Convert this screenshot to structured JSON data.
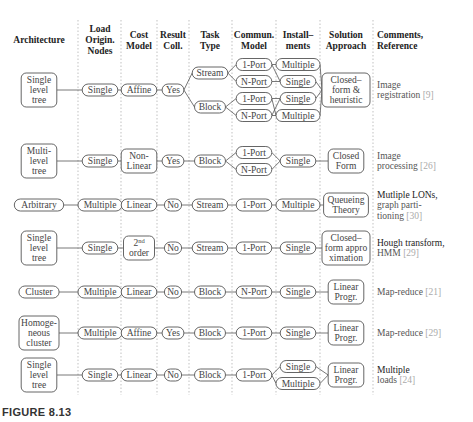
{
  "headers": [
    [
      "Architecture"
    ],
    [
      "Load",
      "Origin.",
      "Nodes"
    ],
    [
      "Cost",
      "Model"
    ],
    [
      "Result",
      "Coll."
    ],
    [
      "Task",
      "Type"
    ],
    [
      "Commun.",
      "Model"
    ],
    [
      "Install–",
      "ments"
    ],
    [
      "Solution",
      "Approach"
    ],
    [
      "Comments,",
      "Reference"
    ]
  ],
  "rows": [
    {
      "nodes": [
        {
          "id": "arch",
          "col": 0,
          "lines": [
            "Single",
            "level",
            "tree"
          ]
        },
        {
          "id": "load",
          "col": 1,
          "lines": [
            "Single"
          ]
        },
        {
          "id": "cost",
          "col": 2,
          "lines": [
            "Affine"
          ]
        },
        {
          "id": "coll",
          "col": 3,
          "lines": [
            "Yes"
          ]
        },
        {
          "id": "t1",
          "col": 4,
          "lines": [
            "Stream"
          ],
          "slot": -2
        },
        {
          "id": "t2",
          "col": 4,
          "lines": [
            "Block"
          ],
          "slot": 2
        },
        {
          "id": "c1",
          "col": 5,
          "lines": [
            "1-Port"
          ],
          "slot": -3
        },
        {
          "id": "c2",
          "col": 5,
          "lines": [
            "N-Port"
          ],
          "slot": -1
        },
        {
          "id": "c3",
          "col": 5,
          "lines": [
            "1-Port"
          ],
          "slot": 1
        },
        {
          "id": "c4",
          "col": 5,
          "lines": [
            "N-Port"
          ],
          "slot": 3
        },
        {
          "id": "i1",
          "col": 6,
          "lines": [
            "Multiple"
          ],
          "slot": -3
        },
        {
          "id": "i2",
          "col": 6,
          "lines": [
            "Single"
          ],
          "slot": -1
        },
        {
          "id": "i3",
          "col": 6,
          "lines": [
            "Single"
          ],
          "slot": 1
        },
        {
          "id": "i4",
          "col": 6,
          "lines": [
            "Multiple"
          ],
          "slot": 3
        },
        {
          "id": "sol",
          "col": 7,
          "lines": [
            "Closed–",
            "form &",
            "heuristic"
          ]
        }
      ],
      "edges": [
        [
          "arch",
          "load"
        ],
        [
          "load",
          "cost"
        ],
        [
          "cost",
          "coll"
        ],
        [
          "coll",
          "t1"
        ],
        [
          "coll",
          "t2"
        ],
        [
          "t1",
          "c1"
        ],
        [
          "t1",
          "c2"
        ],
        [
          "t2",
          "c3"
        ],
        [
          "t2",
          "c4"
        ],
        [
          "c1",
          "i1"
        ],
        [
          "c1",
          "i2"
        ],
        [
          "c2",
          "i2"
        ],
        [
          "c3",
          "i3"
        ],
        [
          "c3",
          "i4"
        ],
        [
          "c4",
          "i3"
        ],
        [
          "c4",
          "i4"
        ],
        [
          "i1",
          "sol"
        ],
        [
          "i2",
          "sol"
        ],
        [
          "i3",
          "sol"
        ],
        [
          "i4",
          "sol"
        ]
      ],
      "comment": {
        "lines": [
          "Image",
          "registration"
        ],
        "ref": "[9]",
        "dark": false
      }
    },
    {
      "nodes": [
        {
          "id": "arch",
          "col": 0,
          "lines": [
            "Multi-",
            "level",
            "tree"
          ]
        },
        {
          "id": "load",
          "col": 1,
          "lines": [
            "Single"
          ]
        },
        {
          "id": "cost",
          "col": 2,
          "lines": [
            "Non-",
            "Linear"
          ]
        },
        {
          "id": "coll",
          "col": 3,
          "lines": [
            "Yes"
          ]
        },
        {
          "id": "task",
          "col": 4,
          "lines": [
            "Block"
          ]
        },
        {
          "id": "c1",
          "col": 5,
          "lines": [
            "1-Port"
          ],
          "slot": -1
        },
        {
          "id": "c2",
          "col": 5,
          "lines": [
            "N-Port"
          ],
          "slot": 1
        },
        {
          "id": "inst",
          "col": 6,
          "lines": [
            "Single"
          ]
        },
        {
          "id": "sol",
          "col": 7,
          "lines": [
            "Closed",
            "Form"
          ]
        }
      ],
      "edges": [
        [
          "arch",
          "load"
        ],
        [
          "load",
          "cost"
        ],
        [
          "cost",
          "coll"
        ],
        [
          "coll",
          "task"
        ],
        [
          "task",
          "c1"
        ],
        [
          "task",
          "c2"
        ],
        [
          "c1",
          "inst"
        ],
        [
          "c2",
          "inst"
        ],
        [
          "inst",
          "sol"
        ]
      ],
      "comment": {
        "lines": [
          "Image",
          "processing"
        ],
        "ref": "[26]",
        "dark": false
      }
    },
    {
      "nodes": [
        {
          "id": "arch",
          "col": 0,
          "lines": [
            "Arbitrary"
          ]
        },
        {
          "id": "load",
          "col": 1,
          "lines": [
            "Multiple"
          ]
        },
        {
          "id": "cost",
          "col": 2,
          "lines": [
            "Linear"
          ]
        },
        {
          "id": "coll",
          "col": 3,
          "lines": [
            "No"
          ]
        },
        {
          "id": "task",
          "col": 4,
          "lines": [
            "Stream"
          ]
        },
        {
          "id": "comm",
          "col": 5,
          "lines": [
            "1-Port"
          ]
        },
        {
          "id": "inst",
          "col": 6,
          "lines": [
            "Multiple"
          ]
        },
        {
          "id": "sol",
          "col": 7,
          "lines": [
            "Queueing",
            "Theory"
          ]
        }
      ],
      "edges": [
        [
          "arch",
          "load"
        ],
        [
          "load",
          "cost"
        ],
        [
          "cost",
          "coll"
        ],
        [
          "coll",
          "task"
        ],
        [
          "task",
          "comm"
        ],
        [
          "comm",
          "inst"
        ],
        [
          "inst",
          "sol"
        ]
      ],
      "comment": {
        "lines": [
          "Mutliple LONs,",
          "graph parti-",
          "tioning"
        ],
        "ref": "[30]",
        "dark": true
      }
    },
    {
      "nodes": [
        {
          "id": "arch",
          "col": 0,
          "lines": [
            "Single",
            "level",
            "tree"
          ]
        },
        {
          "id": "load",
          "col": 1,
          "lines": [
            "Single"
          ]
        },
        {
          "id": "cost",
          "col": 2,
          "lines": [
            "2nd",
            "order"
          ],
          "sup": true
        },
        {
          "id": "coll",
          "col": 3,
          "lines": [
            "No"
          ]
        },
        {
          "id": "task",
          "col": 4,
          "lines": [
            "Stream"
          ]
        },
        {
          "id": "comm",
          "col": 5,
          "lines": [
            "1-Port"
          ]
        },
        {
          "id": "inst",
          "col": 6,
          "lines": [
            "Single"
          ]
        },
        {
          "id": "sol",
          "col": 7,
          "lines": [
            "Closed–",
            "form appro",
            "ximation"
          ]
        }
      ],
      "edges": [
        [
          "arch",
          "load"
        ],
        [
          "load",
          "cost"
        ],
        [
          "cost",
          "coll"
        ],
        [
          "coll",
          "task"
        ],
        [
          "task",
          "comm"
        ],
        [
          "comm",
          "inst"
        ],
        [
          "inst",
          "sol"
        ]
      ],
      "comment": {
        "lines": [
          "Hough transform,",
          "HMM"
        ],
        "ref": "[29]",
        "dark": true
      }
    },
    {
      "nodes": [
        {
          "id": "arch",
          "col": 0,
          "lines": [
            "Cluster"
          ]
        },
        {
          "id": "load",
          "col": 1,
          "lines": [
            "Multiple"
          ]
        },
        {
          "id": "cost",
          "col": 2,
          "lines": [
            "Linear"
          ]
        },
        {
          "id": "coll",
          "col": 3,
          "lines": [
            "No"
          ]
        },
        {
          "id": "task",
          "col": 4,
          "lines": [
            "Block"
          ]
        },
        {
          "id": "comm",
          "col": 5,
          "lines": [
            "N-Port"
          ]
        },
        {
          "id": "inst",
          "col": 6,
          "lines": [
            "Single"
          ]
        },
        {
          "id": "sol",
          "col": 7,
          "lines": [
            "Linear",
            "Progr."
          ]
        }
      ],
      "edges": [
        [
          "arch",
          "load"
        ],
        [
          "load",
          "cost"
        ],
        [
          "cost",
          "coll"
        ],
        [
          "coll",
          "task"
        ],
        [
          "task",
          "comm"
        ],
        [
          "comm",
          "inst"
        ],
        [
          "inst",
          "sol"
        ]
      ],
      "comment": {
        "lines": [
          "Map-reduce"
        ],
        "ref": "[21]",
        "dark": false
      }
    },
    {
      "nodes": [
        {
          "id": "arch",
          "col": 0,
          "lines": [
            "Homoge-",
            "neous",
            "cluster"
          ]
        },
        {
          "id": "load",
          "col": 1,
          "lines": [
            "Multiple"
          ]
        },
        {
          "id": "cost",
          "col": 2,
          "lines": [
            "Affine"
          ]
        },
        {
          "id": "coll",
          "col": 3,
          "lines": [
            "Yes"
          ]
        },
        {
          "id": "task",
          "col": 4,
          "lines": [
            "Block"
          ]
        },
        {
          "id": "comm",
          "col": 5,
          "lines": [
            "1-Port"
          ]
        },
        {
          "id": "inst",
          "col": 6,
          "lines": [
            "Single"
          ]
        },
        {
          "id": "sol",
          "col": 7,
          "lines": [
            "Linear",
            "Progr."
          ]
        }
      ],
      "edges": [
        [
          "arch",
          "load"
        ],
        [
          "load",
          "cost"
        ],
        [
          "cost",
          "coll"
        ],
        [
          "coll",
          "task"
        ],
        [
          "task",
          "comm"
        ],
        [
          "comm",
          "inst"
        ],
        [
          "inst",
          "sol"
        ]
      ],
      "comment": {
        "lines": [
          "Map-reduce"
        ],
        "ref": "[29]",
        "dark": false
      }
    },
    {
      "nodes": [
        {
          "id": "arch",
          "col": 0,
          "lines": [
            "Single",
            "level",
            "tree"
          ]
        },
        {
          "id": "load",
          "col": 1,
          "lines": [
            "Single"
          ]
        },
        {
          "id": "cost",
          "col": 2,
          "lines": [
            "Linear"
          ]
        },
        {
          "id": "coll",
          "col": 3,
          "lines": [
            "No"
          ]
        },
        {
          "id": "task",
          "col": 4,
          "lines": [
            "Block"
          ]
        },
        {
          "id": "comm",
          "col": 5,
          "lines": [
            "1-Port"
          ]
        },
        {
          "id": "i1",
          "col": 6,
          "lines": [
            "Single"
          ],
          "slot": -1
        },
        {
          "id": "i2",
          "col": 6,
          "lines": [
            "Multiple"
          ],
          "slot": 1
        },
        {
          "id": "sol",
          "col": 7,
          "lines": [
            "Linear",
            "Progr."
          ]
        }
      ],
      "edges": [
        [
          "arch",
          "load"
        ],
        [
          "load",
          "cost"
        ],
        [
          "cost",
          "coll"
        ],
        [
          "coll",
          "task"
        ],
        [
          "task",
          "comm"
        ],
        [
          "comm",
          "i1"
        ],
        [
          "comm",
          "i2"
        ],
        [
          "i1",
          "sol"
        ],
        [
          "i2",
          "sol"
        ]
      ],
      "comment": {
        "lines": [
          "Multiple",
          "loads"
        ],
        "ref": "[24]",
        "dark": true
      }
    }
  ],
  "figure_label": "FIGURE 8.13"
}
